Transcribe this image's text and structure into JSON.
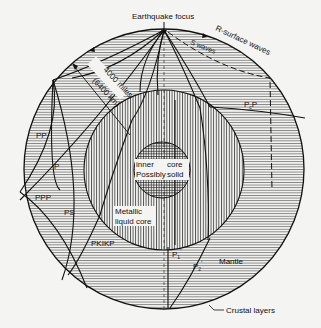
{
  "colors": {
    "background": "#f4f4f2",
    "ink": "#111111"
  },
  "labels": {
    "focus": "Earthquake focus",
    "radius_miles": "4000 miles",
    "radius_km": "(6400 km)",
    "r_waves": "R-surface waves",
    "s_waves": "S waves",
    "pcp": "PcP",
    "pcp_main": "P",
    "pcp_sub": "c",
    "pcp_end": "P",
    "pp": "PP",
    "p": "P",
    "ppp": "PPP",
    "ps": "PS",
    "pkikp": "PKIKP",
    "inner_core_1a": "inner",
    "inner_core_1b": "core",
    "inner_core_2a": "Possibly",
    "inner_core_2b": "solid",
    "outer_core_1": "Metallic",
    "outer_core_2": "liquid core",
    "p1_main": "P",
    "p1_sub": "1",
    "p2_main": "P",
    "p2_sub": "2",
    "prime": "'",
    "mantle": "Mantle",
    "crust": "Crustal layers"
  },
  "geometry": {
    "earth": {
      "cx": 164,
      "cy": 169,
      "r": 140
    },
    "outer_core": {
      "cx": 164,
      "cy": 170,
      "r": 80
    },
    "inner_core": {
      "cx": 162,
      "cy": 170,
      "r": 28
    },
    "focus": {
      "x": 164,
      "y": 30
    }
  }
}
